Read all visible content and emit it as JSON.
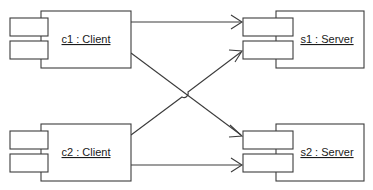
{
  "diagram": {
    "kind": "uml-composite-structure",
    "title": "",
    "background_color": "#ffffff",
    "line_color": "#3c3c3c",
    "text_color": "#1a1a1a",
    "nodes": [
      {
        "id": "c1",
        "label": "c1 : Client",
        "role": "client-instance",
        "underlined": true,
        "box": {
          "x": 41,
          "y": 11,
          "w": 90,
          "h": 57
        },
        "label_pos": {
          "x": 86,
          "y": 42
        },
        "ports": [
          {
            "name": "port-upper",
            "x": 10,
            "y": 18,
            "w": 38,
            "h": 18
          },
          {
            "name": "port-lower",
            "x": 10,
            "y": 41,
            "w": 38,
            "h": 18
          }
        ]
      },
      {
        "id": "c2",
        "label": "c2 : Client",
        "role": "client-instance",
        "underlined": true,
        "box": {
          "x": 41,
          "y": 124,
          "w": 90,
          "h": 57
        },
        "label_pos": {
          "x": 86,
          "y": 155
        },
        "ports": [
          {
            "name": "port-upper",
            "x": 10,
            "y": 131,
            "w": 38,
            "h": 18
          },
          {
            "name": "port-lower",
            "x": 10,
            "y": 154,
            "w": 38,
            "h": 18
          }
        ]
      },
      {
        "id": "s1",
        "label": "s1 : Server",
        "role": "server-instance",
        "underlined": true,
        "box": {
          "x": 276,
          "y": 11,
          "w": 88,
          "h": 57
        },
        "label_pos": {
          "x": 327,
          "y": 42
        },
        "ports": [
          {
            "name": "port-upper",
            "x": 243,
            "y": 18,
            "w": 50,
            "h": 18
          },
          {
            "name": "port-lower",
            "x": 243,
            "y": 41,
            "w": 50,
            "h": 18
          }
        ]
      },
      {
        "id": "s2",
        "label": "s2 : Server",
        "role": "server-instance",
        "underlined": true,
        "box": {
          "x": 276,
          "y": 124,
          "w": 88,
          "h": 57
        },
        "label_pos": {
          "x": 327,
          "y": 155
        },
        "ports": [
          {
            "name": "port-upper",
            "x": 243,
            "y": 131,
            "w": 50,
            "h": 18
          },
          {
            "name": "port-lower",
            "x": 243,
            "y": 154,
            "w": 50,
            "h": 18
          }
        ]
      }
    ],
    "connectors": [
      {
        "id": "c1-to-s1",
        "from": "c1",
        "to": "s1",
        "style": "straight",
        "arrow": "open",
        "path": "M 131 22 L 241 22"
      },
      {
        "id": "c1-to-s2",
        "from": "c1",
        "to": "s2",
        "style": "diagonal",
        "arrow": "open",
        "path": "M 131 53 L 241 135"
      },
      {
        "id": "c2-to-s1",
        "from": "c2",
        "to": "s1",
        "style": "diagonal-with-hop",
        "arrow": "open",
        "path": "M 131 135 L 182 97 A 4.2 4.2 0 0 0 188 92 L 241 52"
      },
      {
        "id": "c2-to-s2",
        "from": "c2",
        "to": "s2",
        "style": "straight",
        "arrow": "open",
        "path": "M 131 165 L 241 165"
      }
    ],
    "arrowheads": [
      {
        "for": "c1-to-s1",
        "tip": {
          "x": 242,
          "y": 22
        },
        "dir": "right"
      },
      {
        "for": "c2-to-s1",
        "tip": {
          "x": 242,
          "y": 51
        },
        "dir": "up-right"
      },
      {
        "for": "c1-to-s2",
        "tip": {
          "x": 242,
          "y": 136
        },
        "dir": "down-right"
      },
      {
        "for": "c2-to-s2",
        "tip": {
          "x": 242,
          "y": 165
        },
        "dir": "right"
      }
    ]
  }
}
